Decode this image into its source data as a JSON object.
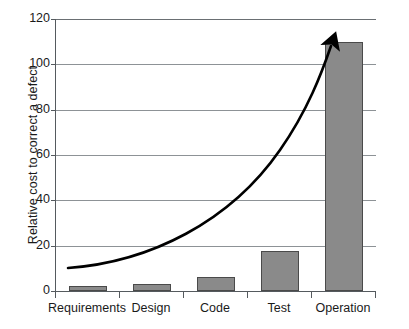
{
  "chart_data": {
    "type": "bar",
    "title": "",
    "xlabel": "",
    "ylabel": "Relative cost to correct a defect",
    "categories": [
      "Requirements",
      "Design",
      "Code",
      "Test",
      "Operation"
    ],
    "values": [
      2,
      3,
      6,
      17.5,
      110
    ],
    "ylim": [
      0,
      120
    ],
    "yticks": [
      0,
      20,
      40,
      60,
      80,
      100,
      120
    ],
    "ytick_labels": [
      "0",
      "20",
      "40",
      "60",
      "80",
      "100",
      "120"
    ],
    "grid": "horizontal",
    "legend": "none",
    "bar_color": "#8a8a8a",
    "bar_border_color": "#4a4a4a",
    "gridline_color": "#8d9296",
    "axis_color": "#555a5e",
    "annotations": [
      {
        "name": "exponential-growth-arrow",
        "type": "curved-arrow",
        "color": "#000000",
        "start_value": 10,
        "end_value": 120,
        "description": "Black curved arrow rising exponentially from left to upper right"
      }
    ]
  },
  "axis": {
    "y_title": "Relative cost to correct a defect"
  }
}
